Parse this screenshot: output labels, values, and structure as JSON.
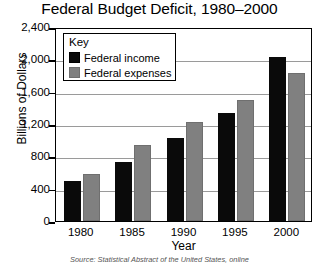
{
  "chart_data": {
    "type": "bar",
    "title": "Federal Budget Deficit, 1980–2000",
    "xlabel": "Year",
    "ylabel": "Billions of Dollars",
    "categories": [
      "1980",
      "1985",
      "1990",
      "1995",
      "2000"
    ],
    "series": [
      {
        "name": "Federal income",
        "color": "#0a0a0a",
        "values": [
          500,
          730,
          1030,
          1340,
          2030
        ]
      },
      {
        "name": "Federal expenses",
        "color": "#808080",
        "values": [
          580,
          940,
          1230,
          1500,
          1830
        ]
      }
    ],
    "ylim": [
      0,
      2400
    ],
    "ytick_values": [
      0,
      400,
      800,
      1200,
      1600,
      2000,
      2400
    ],
    "ytick_labels": [
      "0",
      "400",
      "800",
      "1,200",
      "1,600",
      "2,000",
      "2,400"
    ],
    "grid": "horizontal",
    "legend_position": "inside-top-left",
    "legend_title": "Key",
    "source_note": "Source: Statistical Abstract of the United States, online"
  },
  "legend": {
    "title": "Key",
    "entries": [
      {
        "label": "Federal income",
        "swatch": "black-swatch"
      },
      {
        "label": "Federal expenses",
        "swatch": "gray-swatch"
      }
    ]
  }
}
